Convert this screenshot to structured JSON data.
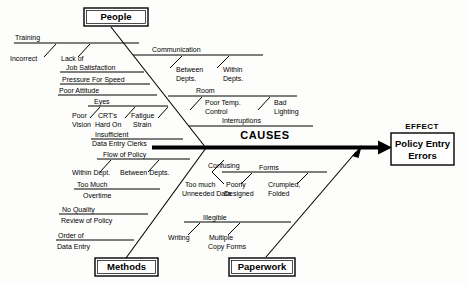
{
  "diagram": {
    "type": "fishbone-ishikawa",
    "spine_label": "CAUSES",
    "effect_title": "EFFECT",
    "effect_text_line1": "Policy Entry",
    "effect_text_line2": "Errors",
    "colors": {
      "stroke": "#000000",
      "background": "#fdfdfc",
      "box_fill": "#ffffff"
    }
  },
  "categories": [
    {
      "id": "people",
      "label": "People"
    },
    {
      "id": "environment",
      "label": ""
    },
    {
      "id": "methods",
      "label": "Methods"
    },
    {
      "id": "paperwork",
      "label": "Paperwork"
    }
  ],
  "bones": {
    "people": [
      {
        "cause": "Training",
        "sub": [
          "Incorrect"
        ]
      },
      {
        "cause": "Lack of",
        "cause2": "Job Satisfaction",
        "sub": []
      },
      {
        "cause": "Pressure For Speed",
        "sub": []
      },
      {
        "cause": "Poor Attitude",
        "sub": []
      },
      {
        "cause": "Eyes",
        "sub": [
          "Poor",
          "Vision",
          "CRT's",
          "Hard On",
          "Fatigue",
          "Strain"
        ]
      },
      {
        "cause": "Insufficient",
        "cause2": "Data Entry Clerks",
        "sub": []
      }
    ],
    "environment": [
      {
        "cause": "Communication",
        "sub": [
          "Between",
          "Depts.",
          "Within",
          "Depts."
        ]
      },
      {
        "cause": "Room",
        "sub": [
          "Poor Temp.",
          "Control",
          "Bad",
          "Lighting"
        ]
      },
      {
        "cause": "Interruptions",
        "sub": []
      }
    ],
    "methods": [
      {
        "cause": "Flow of Policy",
        "sub": [
          "Within Dept.",
          "Between Depts."
        ]
      },
      {
        "cause": "Too Much",
        "cause2": "Overtime",
        "sub": []
      },
      {
        "cause": "No Quality",
        "cause2": "Review of Policy",
        "sub": []
      },
      {
        "cause": "Order of",
        "cause2": "Data Entry",
        "sub": []
      }
    ],
    "paperwork": [
      {
        "cause": "Forms",
        "cause_extra": "Confusing",
        "sub": [
          "Too much",
          "Unneeded Data",
          "Poorly",
          "Designed",
          "Crumpled,",
          "Folded"
        ]
      },
      {
        "cause": "Illegible",
        "sub": [
          "Writing",
          "Multiple",
          "Copy Forms"
        ]
      }
    ]
  },
  "labels": {
    "training": "Training",
    "incorrect": "Incorrect",
    "lack_of": "Lack of",
    "job_satisfaction": "Job Satisfaction",
    "pressure_for_speed": "Pressure For Speed",
    "poor_attitude": "Poor Attitude",
    "eyes": "Eyes",
    "poor": "Poor",
    "vision": "Vision",
    "crts": "CRT's",
    "hard_on": "Hard On",
    "fatigue": "Fatigue",
    "strain": "Strain",
    "insufficient": "Insufficient",
    "data_entry_clerks": "Data Entry Clerks",
    "communication": "Communication",
    "between": "Between",
    "depts1": "Depts.",
    "within": "Within",
    "depts2": "Depts.",
    "room": "Room",
    "poor_temp": "Poor Temp.",
    "control": "Control",
    "bad": "Bad",
    "lighting": "Lighting",
    "interruptions": "Interruptions",
    "flow_of_policy": "Flow of Policy",
    "within_dept": "Within Dept.",
    "between_depts": "Between Depts.",
    "too_much": "Too Much",
    "overtime": "Overtime",
    "no_quality": "No Quality",
    "review_of_policy": "Review of Policy",
    "order_of": "Order of",
    "data_entry": "Data Entry",
    "confusing": "Confusing",
    "forms": "Forms",
    "too_much2": "Too much",
    "unneeded_data": "Unneeded Data",
    "poorly": "Poorly",
    "designed": "Designed",
    "crumpled": "Crumpled,",
    "folded": "Folded",
    "illegible": "Illegible",
    "writing": "Writing",
    "multiple": "Multiple",
    "copy_forms": "Copy Forms",
    "people_box": "People",
    "methods_box": "Methods",
    "paperwork_box": "Paperwork",
    "causes": "CAUSES",
    "effect": "EFFECT",
    "effect_line1": "Policy Entry",
    "effect_line2": "Errors"
  }
}
